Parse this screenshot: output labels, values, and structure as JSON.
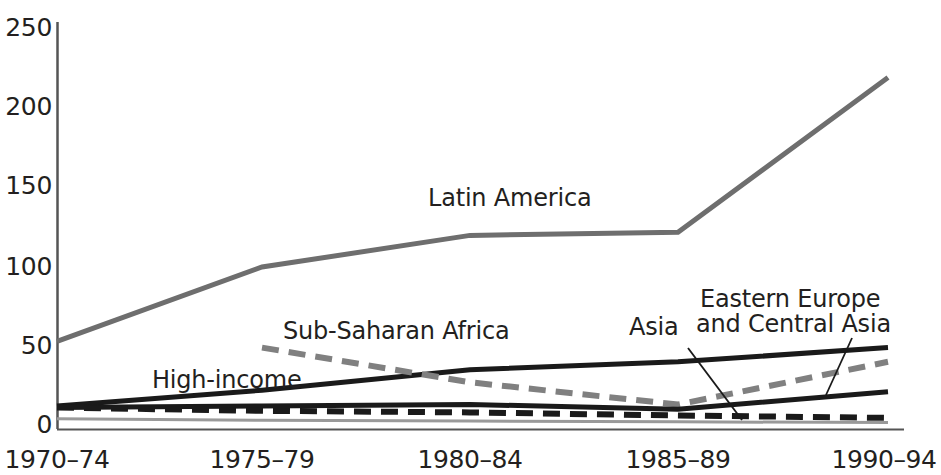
{
  "chart_data": {
    "type": "line",
    "title": "",
    "subtitle": "",
    "xlabel": "",
    "ylabel": "",
    "categories": [
      "1970–74",
      "1975–79",
      "1980–84",
      "1985–89",
      "1990–94"
    ],
    "x_positions": [
      57,
      262,
      470,
      678,
      888
    ],
    "ylim": [
      0,
      250
    ],
    "yticks": [
      0,
      50,
      100,
      150,
      200,
      250
    ],
    "grid": false,
    "legend": "inline-annotations",
    "series": [
      {
        "name": "Latin America",
        "values": [
          53,
          100,
          120,
          122,
          220
        ],
        "color": "#6e6e6e",
        "style": "solid",
        "width": 5
      },
      {
        "name": "High-income",
        "values": [
          12,
          22,
          35,
          40,
          49
        ],
        "color": "#1a1a1a",
        "style": "solid",
        "width": 5
      },
      {
        "name": "Sub-Saharan Africa",
        "values": [
          null,
          49,
          27,
          13,
          40
        ],
        "color": "#808080",
        "style": "dashed",
        "width": 6
      },
      {
        "name": "Asia",
        "values": [
          11,
          12,
          13,
          10,
          21
        ],
        "color": "#1a1a1a",
        "style": "solid",
        "width": 5
      },
      {
        "name": "Eastern Europe and Central Asia",
        "values": [
          11,
          9,
          8,
          6,
          4.5
        ],
        "color": "#1a1a1a",
        "style": "dashed",
        "width": 6
      },
      {
        "name": "baseline-gray",
        "values": [
          4,
          3,
          2.5,
          2,
          1.5
        ],
        "color": "#9a9a9a",
        "style": "solid",
        "width": 3
      }
    ],
    "annotations": [
      {
        "text": "Latin America",
        "x": 428,
        "y": 184
      },
      {
        "text": "Sub-Saharan Africa",
        "x": 283,
        "y": 317
      },
      {
        "text": "High-income",
        "x": 152,
        "y": 366
      },
      {
        "text": "Asia",
        "x": 629,
        "y": 313
      },
      {
        "text": "Eastern Europe",
        "x": 700,
        "y": 285
      },
      {
        "text": "and Central Asia",
        "x": 696,
        "y": 310
      }
    ],
    "leader_lines": [
      {
        "from": [
          688,
          348
        ],
        "to": [
          742,
          420
        ]
      },
      {
        "from": [
          852,
          338
        ],
        "to": [
          826,
          395
        ]
      }
    ]
  },
  "axis": {
    "ytick_labels": [
      "250",
      "200",
      "150",
      "100",
      "50",
      "0"
    ],
    "ytick_y": [
      13,
      92,
      171,
      252,
      331,
      410
    ],
    "xtick_labels": [
      "1970–74",
      "1975–79",
      "1980–84",
      "1985–89",
      "1990–94"
    ],
    "xtick_x": [
      57,
      262,
      470,
      678,
      888
    ],
    "axis_color": "#555555"
  }
}
